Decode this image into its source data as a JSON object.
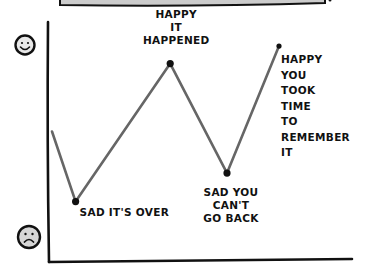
{
  "chart_data": {
    "type": "line",
    "title": "",
    "xlabel": "",
    "ylabel": "",
    "y_axis_icons": {
      "top": "happy-face",
      "bottom": "sad-face"
    },
    "ylim": [
      0,
      10
    ],
    "grid": false,
    "legend": "none",
    "colors": {
      "line": "#666666",
      "points": "#111111",
      "axis": "#111111",
      "top_box": "#cccccc"
    },
    "series": [
      {
        "name": "feeling",
        "x": [
          0,
          1,
          5,
          7.4,
          9.6
        ],
        "y": [
          5.0,
          1.8,
          8.1,
          3.1,
          8.9
        ]
      }
    ],
    "points": [
      {
        "x": 1,
        "y": 1.8,
        "label_lines": [
          "SAD IT'S OVER"
        ]
      },
      {
        "x": 5,
        "y": 8.1,
        "label_lines": [
          "HAPPY",
          "IT",
          "HAPPENED"
        ]
      },
      {
        "x": 7.4,
        "y": 3.1,
        "label_lines": [
          "SAD YOU",
          "CAN'T",
          "GO BACK"
        ]
      },
      {
        "x": 9.6,
        "y": 8.9,
        "label_lines": [
          "HAPPY",
          "YOU",
          "TOOK",
          "TIME",
          "TO",
          "REMEMBER",
          "IT"
        ]
      }
    ]
  }
}
